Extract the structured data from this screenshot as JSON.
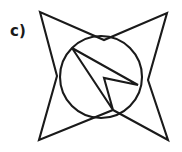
{
  "figure": {
    "label": "c)",
    "canvas": {
      "width": 182,
      "height": 152,
      "background": "#ffffff"
    },
    "stroke_color": "#1a1a1a",
    "stroke_width": 2.1,
    "shapes": {
      "star": {
        "name": "four-pointed-concave-star",
        "points": "40,12 57,76 39,140 113,110 168,140 148,80 167,13 104,40",
        "description": "concave eight-vertex star outline with four outer points at the corners"
      },
      "circle": {
        "name": "inscribed-circle",
        "cx": 101,
        "cy": 77,
        "r": 41
      },
      "bolt": {
        "name": "inner-lightning-polygon",
        "points": "72,48 138,85 104,78 113,110",
        "description": "four vertex arrow/lightning shape inside the circle"
      }
    }
  }
}
